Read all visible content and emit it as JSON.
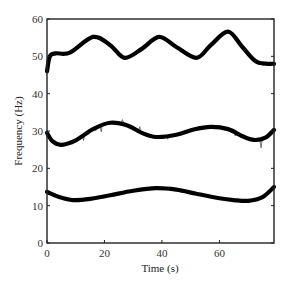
{
  "chart_data": {
    "type": "line",
    "title": "",
    "xlabel": "Time (s)",
    "ylabel": "Frequency (Hz)",
    "xlim": [
      0,
      79
    ],
    "ylim": [
      0,
      60
    ],
    "xticks": [
      0,
      20,
      40,
      60
    ],
    "yticks": [
      0,
      10,
      20,
      30,
      40,
      50,
      60
    ],
    "grid": false,
    "legend": null,
    "series": [
      {
        "name": "upper band (smoothed)",
        "color": "#000000",
        "x": [
          0,
          1,
          3,
          8,
          16,
          22,
          27,
          33,
          39,
          45,
          52,
          57,
          63,
          68,
          73,
          79
        ],
        "y": [
          46,
          50,
          50.8,
          51,
          55.2,
          53,
          49.6,
          52,
          55.2,
          52.5,
          49.6,
          53,
          56.6,
          52.5,
          48.5,
          48
        ]
      },
      {
        "name": "middle band (smoothed)",
        "color": "#000000",
        "x": [
          0,
          2,
          5,
          10,
          16,
          22,
          28,
          33,
          38,
          45,
          51,
          57,
          63,
          68,
          72,
          76,
          79
        ],
        "y": [
          29.5,
          27.2,
          26.3,
          27.5,
          30.5,
          32.2,
          31.5,
          29.5,
          28.4,
          29,
          30.4,
          31.1,
          30.5,
          28.6,
          27.6,
          28.2,
          30.3
        ]
      },
      {
        "name": "lower band (smoothed)",
        "color": "#000000",
        "x": [
          0,
          4,
          9,
          15,
          22,
          30,
          38,
          45,
          52,
          60,
          65,
          70,
          75,
          79
        ],
        "y": [
          13.7,
          12.4,
          11.5,
          11.8,
          12.8,
          14,
          14.7,
          14.3,
          13.2,
          12,
          11.5,
          11.3,
          12.3,
          15
        ]
      }
    ]
  }
}
